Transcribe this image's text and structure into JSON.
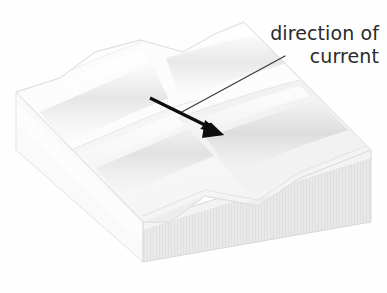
{
  "figure": {
    "title": "direction of current",
    "background_color": "#fefefe",
    "annotation": {
      "name": "direction-of-current-label",
      "lines": [
        "direction of",
        "current"
      ],
      "text_color": "#2b2b2b",
      "align": "right"
    },
    "leader_line": {
      "name": "leader-line",
      "color": "#3a3a3a",
      "width": 1.2,
      "from": [
        285,
        56
      ],
      "to": [
        180,
        113
      ]
    },
    "flow_arrow": {
      "name": "flow-direction-arrow",
      "color": "#0d0d0d",
      "shaft_width": 3.2,
      "tail": [
        150,
        98
      ],
      "tip": [
        222,
        134
      ],
      "head_length": 20,
      "head_width": 13
    },
    "block": {
      "name": "sediment-block",
      "description": "isometric rectangular block with rippled upper surface",
      "top_face_color": "#fafafa",
      "left_face_color": "#f7f7f7",
      "right_face_color": "#e8e8e8",
      "edge_color": "#dcdcdc",
      "ripple_count": 4,
      "ripple_shadow_color": "#dddddd",
      "ripple_highlight_color": "#ffffff",
      "corners": {
        "top_back_left": [
          16,
          92
        ],
        "top_back_right": [
          244,
          22
        ],
        "top_front_right": [
          371,
          150
        ],
        "top_front_left": [
          143,
          222
        ],
        "bottom_front_left": [
          143,
          262
        ],
        "bottom_front_right": [
          371,
          222
        ],
        "bottom_back_left": [
          16,
          150
        ]
      }
    }
  }
}
